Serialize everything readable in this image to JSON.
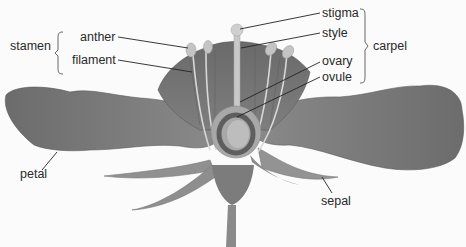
{
  "diagram": {
    "type": "flower-anatomy",
    "labels": {
      "stamen": "stamen",
      "anther": "anther",
      "filament": "filament",
      "stigma": "stigma",
      "style": "style",
      "carpel": "carpel",
      "ovary": "ovary",
      "ovule": "ovule",
      "petal": "petal",
      "sepal": "sepal"
    },
    "groups": {
      "stamen": [
        "anther",
        "filament"
      ],
      "carpel": [
        "stigma",
        "style",
        "ovary",
        "ovule"
      ]
    },
    "colors": {
      "background": "#fbfbfb",
      "petal_dark": "#6a6a6a",
      "petal_mid": "#808080",
      "sepal": "#8c8c8c",
      "pistil_light": "#c8c8c8",
      "ovary_ring": "#5e5e5e",
      "leader_line": "#222222"
    }
  }
}
